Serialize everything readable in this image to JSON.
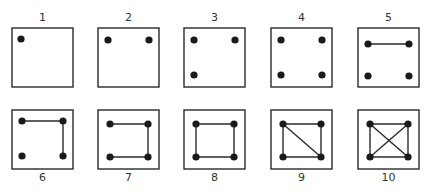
{
  "figure": {
    "caption": "",
    "panels": [
      {
        "label": "1",
        "dots": [
          "tl"
        ],
        "edges": []
      },
      {
        "label": "2",
        "dots": [
          "tl",
          "tr"
        ],
        "edges": []
      },
      {
        "label": "3",
        "dots": [
          "tl",
          "tr",
          "bl"
        ],
        "edges": []
      },
      {
        "label": "4",
        "dots": [
          "tl",
          "tr",
          "bl",
          "br"
        ],
        "edges": []
      },
      {
        "label": "5",
        "dots": [
          "tl",
          "tr",
          "bl",
          "br"
        ],
        "edges": [
          [
            "tl",
            "tr"
          ]
        ]
      },
      {
        "label": "6",
        "dots": [
          "tl",
          "tr",
          "bl",
          "br"
        ],
        "edges": [
          [
            "tl",
            "tr"
          ],
          [
            "tr",
            "br"
          ]
        ]
      },
      {
        "label": "7",
        "dots": [
          "tl",
          "tr",
          "bl",
          "br"
        ],
        "edges": [
          [
            "tl",
            "tr"
          ],
          [
            "tr",
            "br"
          ],
          [
            "br",
            "bl"
          ]
        ]
      },
      {
        "label": "8",
        "dots": [
          "tl",
          "tr",
          "bl",
          "br"
        ],
        "edges": [
          [
            "tl",
            "tr"
          ],
          [
            "tr",
            "br"
          ],
          [
            "br",
            "bl"
          ],
          [
            "bl",
            "tl"
          ]
        ]
      },
      {
        "label": "9",
        "dots": [
          "tl",
          "tr",
          "bl",
          "br"
        ],
        "edges": [
          [
            "tl",
            "tr"
          ],
          [
            "tr",
            "br"
          ],
          [
            "br",
            "bl"
          ],
          [
            "bl",
            "tl"
          ],
          [
            "tl",
            "br"
          ]
        ]
      },
      {
        "label": "10",
        "dots": [
          "tl",
          "tr",
          "bl",
          "br"
        ],
        "edges": [
          [
            "tl",
            "tr"
          ],
          [
            "tr",
            "br"
          ],
          [
            "br",
            "bl"
          ],
          [
            "bl",
            "tl"
          ],
          [
            "tl",
            "br"
          ],
          [
            "tr",
            "bl"
          ]
        ]
      }
    ]
  },
  "colors": {
    "stroke": "#2a2a2a",
    "dot": "#1a1a1a"
  }
}
